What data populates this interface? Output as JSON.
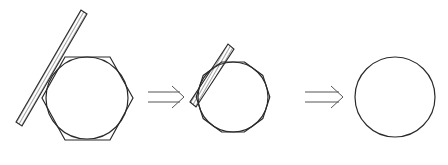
{
  "stages": [
    {
      "id": "stage-1",
      "polygon_sides": 6,
      "has_bar": true
    },
    {
      "id": "stage-2",
      "polygon_sides": 10,
      "has_bar": true
    },
    {
      "id": "stage-3",
      "polygon_sides": 0,
      "has_bar": false
    }
  ],
  "arrows": [
    {
      "from": "stage-1",
      "to": "stage-2",
      "symbol": "implies-arrow"
    },
    {
      "from": "stage-2",
      "to": "stage-3",
      "symbol": "implies-arrow"
    }
  ],
  "colors": {
    "stroke": "#2a2a2a",
    "arrow": "#555555",
    "background": "#ffffff"
  }
}
